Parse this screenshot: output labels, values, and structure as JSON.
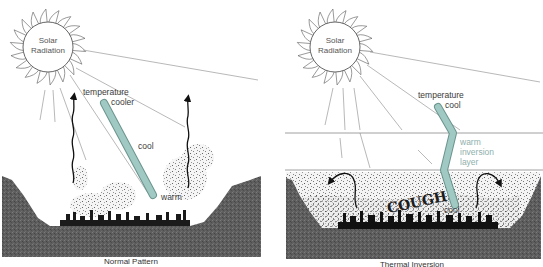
{
  "colors": {
    "ground": "#5c5c5c",
    "ground_dark": "#3f3f3f",
    "thermometer_fill": "#9fc9c2",
    "thermometer_stroke": "#6a948d",
    "inversion_text": "#8fb0ac",
    "ray": "#9a9a9a",
    "sun_stroke": "#555555"
  },
  "panels": [
    {
      "id": "normal",
      "caption": "Normal Pattern",
      "sun": {
        "line1": "Solar",
        "line2": "Radiation"
      },
      "labels": {
        "temperature": "temperature",
        "top": "cooler",
        "middle": "cool",
        "bottom": "warm"
      }
    },
    {
      "id": "inversion",
      "caption": "Thermal Inversion",
      "sun": {
        "line1": "Solar",
        "line2": "Radiation"
      },
      "labels": {
        "temperature": "temperature",
        "top": "cool",
        "layer_line1": "warm",
        "layer_line2": "inversion",
        "layer_line3": "layer",
        "bottom": "cool",
        "smog_word": "COUGH"
      }
    }
  ]
}
